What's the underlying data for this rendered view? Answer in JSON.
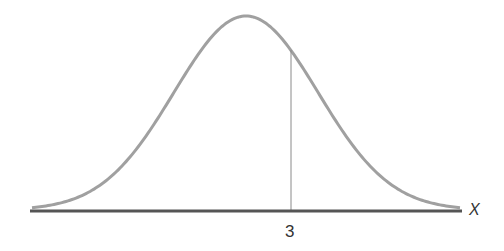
{
  "diagram": {
    "type": "normal-distribution-curve",
    "marker_label": "3",
    "axis_label": "X",
    "colors": {
      "curve": "#9a9a9a",
      "axis": "#555555",
      "marker_line": "#8a8a8a",
      "text": "#333333"
    }
  }
}
